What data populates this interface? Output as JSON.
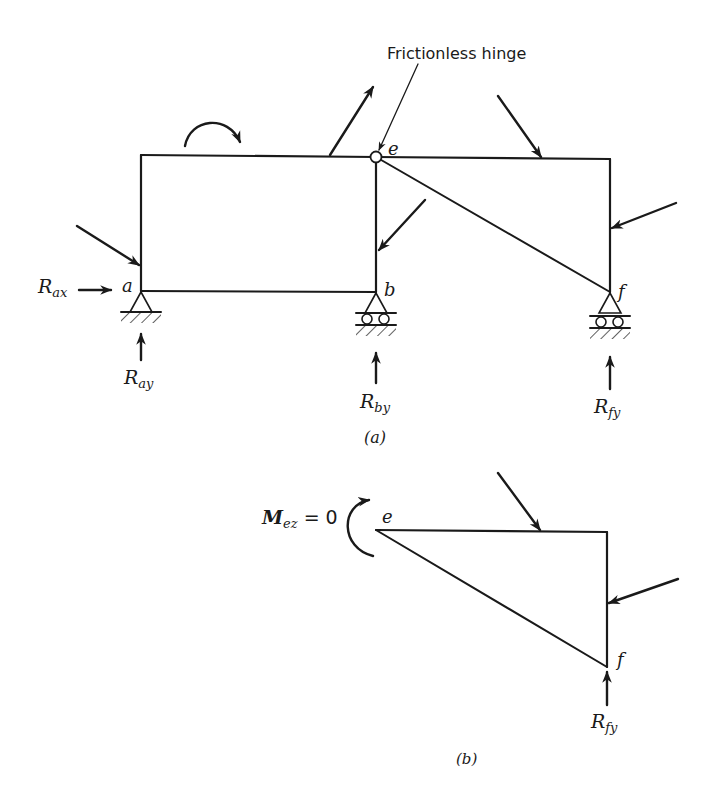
{
  "header": {
    "cropped_text": ""
  },
  "figure_a": {
    "callout": "Frictionless hinge",
    "nodes": {
      "a": "a",
      "b": "b",
      "e": "e",
      "f": "f"
    },
    "reactions": {
      "Rax": {
        "main": "R",
        "sub": "ax"
      },
      "Ray": {
        "main": "R",
        "sub": "ay"
      },
      "Rby": {
        "main": "R",
        "sub": "by"
      },
      "Rfy": {
        "main": "R",
        "sub": "fy"
      }
    },
    "caption": "(a)"
  },
  "figure_b": {
    "moment": {
      "main": "M",
      "sub": "ez",
      "eq": "= 0"
    },
    "nodes": {
      "e": "e",
      "f": "f"
    },
    "reactions": {
      "Rfy": {
        "main": "R",
        "sub": "fy"
      }
    },
    "caption": "(b)"
  },
  "colors": {
    "ink": "#1a1a1a",
    "background": "#ffffff"
  }
}
